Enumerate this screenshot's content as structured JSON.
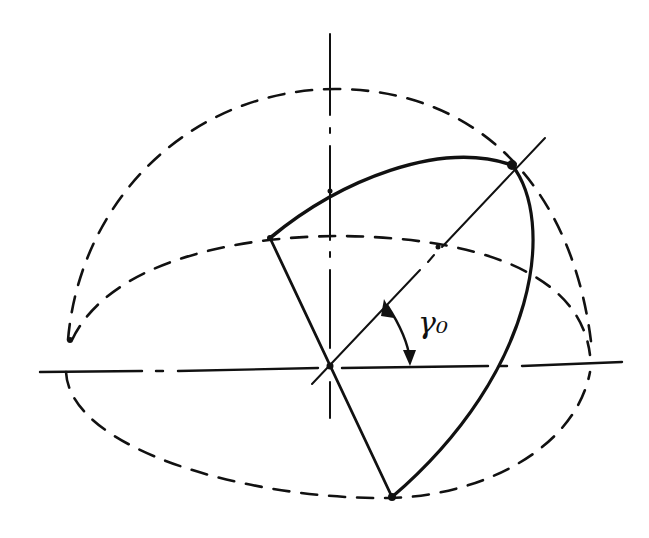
{
  "diagram": {
    "colors": {
      "stroke": "#111111",
      "background": "#ffffff"
    },
    "angle_label": "γ₀",
    "center": {
      "x": 330,
      "y": 365
    },
    "points": {
      "left_vertex": {
        "x": 270,
        "y": 238
      },
      "top_vertex": {
        "x": 512,
        "y": 165
      },
      "bottom_vertex": {
        "x": 392,
        "y": 497
      },
      "vertical_axis_crossing": {
        "x": 330,
        "y": 191
      },
      "equator_left": {
        "x": 68,
        "y": 340
      },
      "equator_right": {
        "x": 590,
        "y": 355
      }
    }
  }
}
